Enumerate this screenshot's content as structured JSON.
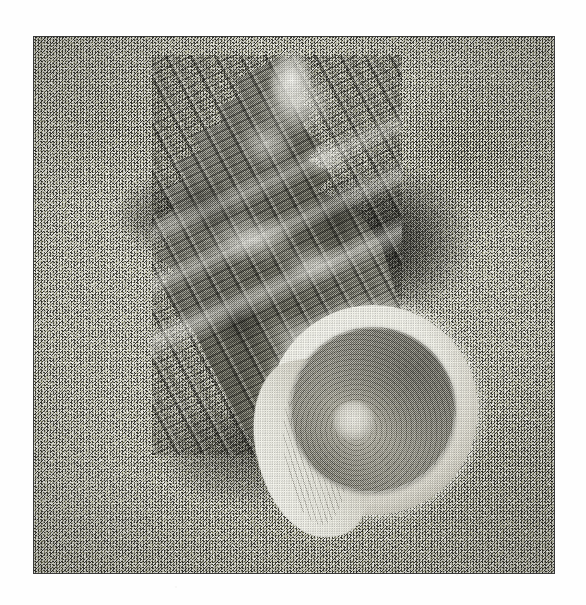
{
  "page": {
    "kind": "photograph",
    "medium": "black-and-white halftone print",
    "width": 586,
    "height": 605,
    "background_color": "#fefefe"
  },
  "frame": {
    "border_color": "#3a3a3a",
    "border_width_px": 1,
    "left": 33,
    "top": 36,
    "width": 522,
    "height": 538
  },
  "scene": {
    "subject": "marine gastropod sea shell",
    "subject_common_name": "turban / murex-like knobbed sea snail shell",
    "setting": "coarse sand",
    "lighting": "diffuse top-left key light with cast shadow to the right",
    "orientation": "spire pointing up, aperture facing lower-right toward viewer",
    "palette": {
      "sand_mid": "#9c9c97",
      "sand_light": "#e6e6e0",
      "sand_dark": "#4a4a46",
      "shadow": "#1a1a18",
      "shell_dark": "#737369",
      "shell_mid": "#9b9b92",
      "shell_light": "#fbfbf6",
      "operculum": "#a1a096",
      "lip_white": "#f7f7f0"
    }
  },
  "shell": {
    "spire": {
      "label": "spire",
      "apex_x": 290,
      "apex_y": 56,
      "whorl_count": 5,
      "description": "stepped conical spire with nodular knobs and spiral cords"
    },
    "body_whorl": {
      "label": "body whorl",
      "description": "broad ribbed whorl with raised spiral cords and mottled dark/light banding"
    },
    "aperture": {
      "label": "aperture",
      "center_x": 372,
      "center_y": 409,
      "radius": 105,
      "lip_label": "flared scalloped outer lip",
      "lip_color": "#f7f7f0"
    },
    "operculum": {
      "label": "operculum",
      "center_x": 372,
      "center_y": 409,
      "radius": 83,
      "ring_count": 16,
      "nucleus_x": 353,
      "nucleus_y": 420,
      "description": "circular calcareous door with concentric growth rings and a pale off-centre nucleus"
    },
    "columella": {
      "label": "columella",
      "description": "glossy white inner wall with fine transverse grooves"
    }
  },
  "shadows": [
    {
      "name": "right-cast-shadow",
      "x": 300,
      "y": 150,
      "width": 200,
      "height": 190,
      "intensity": "strong"
    },
    {
      "name": "upper-left-shadow",
      "x": 90,
      "y": 160,
      "width": 150,
      "height": 110,
      "intensity": "medium"
    },
    {
      "name": "lower-left-shadow",
      "x": 150,
      "y": 390,
      "width": 220,
      "height": 150,
      "intensity": "medium"
    }
  ],
  "caption": ""
}
